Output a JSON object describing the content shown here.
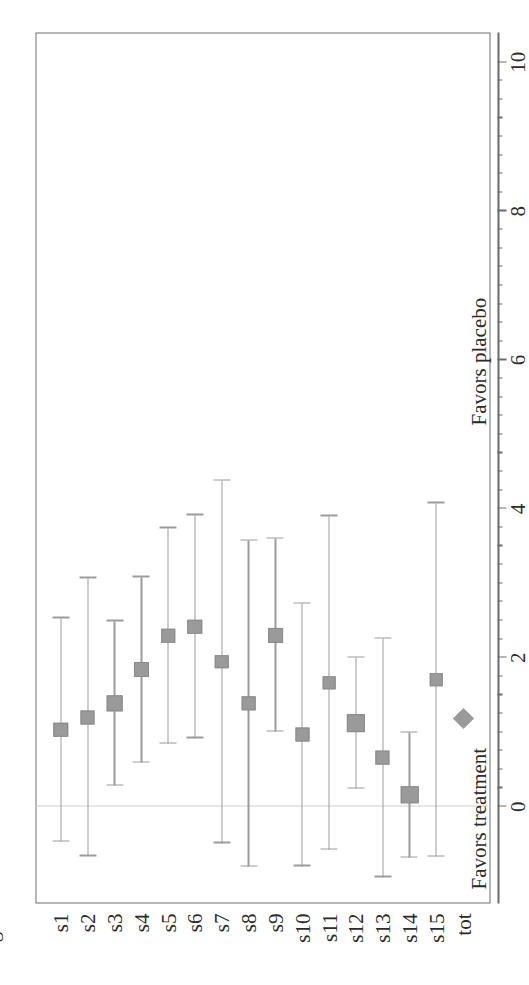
{
  "chart_data": {
    "type": "scatter",
    "subtype": "forest-plot",
    "title": "",
    "xlabel": "",
    "ylabel": "",
    "xlim": [
      -1.3,
      10.4
    ],
    "xticks": [
      0,
      2,
      4,
      6,
      8,
      10
    ],
    "xticklabels": [
      "0",
      "2",
      "4",
      "6",
      "8",
      "10"
    ],
    "minor_tick_step": 0.25,
    "grid": false,
    "zero_reference": 0,
    "annotations": {
      "left": "Favors treatment",
      "right": "Favors placebo"
    },
    "columns": [
      "log_OR",
      "LCL",
      "UCL",
      "Weight"
    ],
    "categories": [
      "s1",
      "s2",
      "s3",
      "s4",
      "s5",
      "s6",
      "s7",
      "s8",
      "s9",
      "s10",
      "s11",
      "s12",
      "s13",
      "s14",
      "s15",
      "tot"
    ],
    "rows": [
      {
        "study": "s1",
        "log_OR": "1.034",
        "lcl": "-.466",
        "ucl": "2.535",
        "weight": "9%",
        "est": 1.034,
        "lo": -0.466,
        "hi": 2.535,
        "marker": "square",
        "size": 9
      },
      {
        "study": "s2",
        "log_OR": "1.204",
        "lcl": "-.664",
        "ucl": "3.072",
        "weight": "6%",
        "est": 1.204,
        "lo": -0.664,
        "hi": 3.072,
        "marker": "square",
        "size": 6
      },
      {
        "study": "s3",
        "log_OR": "1.389",
        "lcl": "0.287",
        "ucl": "2.492",
        "weight": "16%",
        "est": 1.389,
        "lo": 0.287,
        "hi": 2.492,
        "marker": "square",
        "size": 16
      },
      {
        "study": "s4",
        "log_OR": "1.838",
        "lcl": "0.595",
        "ucl": "3.082",
        "weight": "12%",
        "est": 1.838,
        "lo": 0.595,
        "hi": 3.082,
        "marker": "square",
        "size": 12
      },
      {
        "study": "s5",
        "log_OR": "2.294",
        "lcl": "0.845",
        "ucl": "3.744",
        "weight": "9%",
        "est": 2.294,
        "lo": 0.845,
        "hi": 3.744,
        "marker": "square",
        "size": 9
      },
      {
        "study": "s6",
        "log_OR": "2.420",
        "lcl": "0.923",
        "ucl": "3.917",
        "weight": "9%",
        "est": 2.42,
        "lo": 0.923,
        "hi": 3.917,
        "marker": "square",
        "size": 9
      },
      {
        "study": "s7",
        "log_OR": "1.946",
        "lcl": "-.489",
        "ucl": "4.380",
        "weight": "3%",
        "est": 1.946,
        "lo": -0.489,
        "hi": 4.38,
        "marker": "square",
        "size": 3
      },
      {
        "study": "s8",
        "log_OR": "1.386",
        "lcl": "-.805",
        "ucl": "3.578",
        "weight": "4%",
        "est": 1.386,
        "lo": -0.805,
        "hi": 3.578,
        "marker": "square",
        "size": 4
      },
      {
        "study": "s9",
        "log_OR": "2.305",
        "lcl": "1.007",
        "ucl": "3.603",
        "weight": "11%",
        "est": 2.305,
        "lo": 1.007,
        "hi": 3.603,
        "marker": "square",
        "size": 11
      },
      {
        "study": "s10",
        "log_OR": "0.965",
        "lcl": "-.798",
        "ucl": "2.729",
        "weight": "6%",
        "est": 0.965,
        "lo": -0.798,
        "hi": 2.729,
        "marker": "square",
        "size": 6
      },
      {
        "study": "s11",
        "log_OR": "1.664",
        "lcl": "-.578",
        "ucl": "3.905",
        "weight": "4%",
        "est": 1.664,
        "lo": -0.578,
        "hi": 3.905,
        "marker": "square",
        "size": 4
      },
      {
        "study": "s12",
        "log_OR": "1.123",
        "lcl": "0.240",
        "ucl": "2.007",
        "weight": "25%",
        "est": 1.123,
        "lo": 0.24,
        "hi": 2.007,
        "marker": "square",
        "size": 25
      },
      {
        "study": "s13",
        "log_OR": "0.657",
        "lcl": "-.948",
        "ucl": "2.262",
        "weight": "7%",
        "est": 0.657,
        "lo": -0.948,
        "hi": 2.262,
        "marker": "square",
        "size": 7
      },
      {
        "study": "s14",
        "log_OR": "0.158",
        "lcl": "-.681",
        "ucl": "0.996",
        "weight": "27%",
        "est": 0.158,
        "lo": -0.681,
        "hi": 0.996,
        "marker": "square",
        "size": 27
      },
      {
        "study": "s15",
        "log_OR": "1.705",
        "lcl": "-.668",
        "ucl": "4.078",
        "weight": "3%",
        "est": 1.705,
        "lo": -0.668,
        "hi": 4.078,
        "marker": "square",
        "size": 3
      },
      {
        "study": "tot",
        "log_OR": "",
        "lcl": "",
        "ucl": "",
        "weight": "",
        "est": 1.18,
        "lo": null,
        "hi": null,
        "marker": "diamond",
        "size": 0
      }
    ]
  },
  "headers": {
    "log_or": "log_OR",
    "lcl": "LCL",
    "ucl": "UCL",
    "weight": "Weight"
  },
  "axis": {
    "favors_treatment": "Favors treatment",
    "favors_placebo": "Favors placebo"
  }
}
